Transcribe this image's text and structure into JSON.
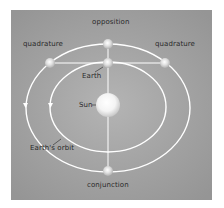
{
  "diagram": {
    "labels": {
      "opposition": "opposition",
      "quadrature_left": "quadrature",
      "quadrature_right": "quadrature",
      "earth": "Earth",
      "sun": "Sun",
      "earths_orbit": "Earth's orbit",
      "conjunction": "conjunction"
    },
    "colors": {
      "background": "#a2a2a2",
      "orbit": "#ffffff",
      "text": "#2a2a2a"
    },
    "bodies": [
      "Sun",
      "Earth",
      "Planet at opposition",
      "Planet at quadrature (left)",
      "Planet at quadrature (right)",
      "Planet at conjunction"
    ],
    "orbits": [
      "Earth's orbit (inner)",
      "Outer planet orbit"
    ]
  }
}
